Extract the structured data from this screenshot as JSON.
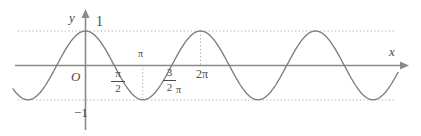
{
  "figure": {
    "background": "#ffffff",
    "width": 421,
    "height": 136
  },
  "axes": {
    "x_axis": {
      "label": "x",
      "color": "#8a8a8a",
      "arrow": "right"
    },
    "y_axis": {
      "label": "y",
      "color": "#8a8a8a",
      "arrow": "up"
    },
    "origin_label": "O"
  },
  "labels": {
    "y_max": "1",
    "y_min": "−1",
    "pi": "π",
    "two_pi": "2π",
    "pi_over_two_numerator": "π",
    "pi_over_two_denominator": "2",
    "three_halves_numerator": "3",
    "three_halves_denominator": "2",
    "three_halves_pi_tail": "π"
  },
  "guides": {
    "upper_dotted_value": 1,
    "lower_dotted_value": -1,
    "vertical_dotted_at": [
      "π",
      "2π"
    ],
    "color": "#a9a9a9",
    "style": "dotted"
  },
  "chart_data": {
    "type": "line",
    "title": "",
    "subtitle": "",
    "xlabel": "x",
    "ylabel": "y",
    "function": "y = cos(x)",
    "amplitude": 1,
    "period": "2π",
    "xlim": [
      -1.22,
      5.5
    ],
    "ylim": [
      -1.35,
      1.35
    ],
    "grid": false,
    "legend": null,
    "x_ticks": [
      {
        "value": 0,
        "label": "O"
      },
      {
        "value": 1.5707963,
        "label": "π/2"
      },
      {
        "value": 3.1415927,
        "label": "π"
      },
      {
        "value": 4.712389,
        "label": "3/2 π"
      },
      {
        "value": 6.2831853,
        "label": "2π"
      }
    ],
    "y_ticks": [
      {
        "value": 1,
        "label": "1"
      },
      {
        "value": -1,
        "label": "−1"
      }
    ],
    "key_points": [
      {
        "x": "0",
        "y": 1,
        "kind": "maximum"
      },
      {
        "x": "π/2",
        "y": 0,
        "kind": "zero"
      },
      {
        "x": "π",
        "y": -1,
        "kind": "minimum"
      },
      {
        "x": "3/2 π",
        "y": 0,
        "kind": "zero"
      },
      {
        "x": "2π",
        "y": 1,
        "kind": "maximum"
      },
      {
        "x": "5/2 π",
        "y": 0,
        "kind": "zero"
      },
      {
        "x": "3π",
        "y": -1,
        "kind": "minimum"
      },
      {
        "x": "7/2 π",
        "y": 0,
        "kind": "zero"
      },
      {
        "x": "4π",
        "y": 1,
        "kind": "maximum"
      }
    ],
    "series": [
      {
        "name": "y = cos x",
        "color": "#7d7d7d",
        "x": [
          -1.22,
          -1.0,
          -0.8,
          -0.6,
          -0.4,
          -0.2,
          0.0,
          0.2,
          0.4,
          0.6,
          0.8,
          1.0,
          1.2,
          1.4,
          1.5708,
          1.8,
          2.0,
          2.2,
          2.4,
          2.6,
          2.8,
          3.0,
          3.1416,
          3.4,
          3.6,
          3.8,
          4.0,
          4.2,
          4.4,
          4.6,
          4.7124,
          5.0,
          5.2,
          5.4,
          5.6,
          5.8,
          6.0,
          6.2832,
          6.6,
          6.8,
          7.0,
          7.2,
          7.4,
          7.6,
          7.8,
          7.854,
          8.2,
          8.4,
          8.6,
          8.8,
          9.0,
          9.2,
          9.4248,
          9.8,
          10.0,
          10.2,
          10.4,
          10.6,
          10.8,
          10.9956,
          11.4,
          11.6,
          11.8,
          12.0,
          12.2,
          12.4,
          12.5664,
          12.9,
          13.2
        ],
        "y": [
          0.344,
          0.54,
          0.697,
          0.825,
          0.921,
          0.98,
          1.0,
          0.98,
          0.921,
          0.825,
          0.697,
          0.54,
          0.362,
          0.17,
          0.0,
          -0.227,
          -0.416,
          -0.589,
          -0.737,
          -0.857,
          -0.942,
          -0.99,
          -1.0,
          -0.967,
          -0.897,
          -0.791,
          -0.654,
          -0.49,
          -0.307,
          -0.112,
          0.0,
          0.284,
          0.469,
          0.635,
          0.776,
          0.886,
          0.96,
          1.0,
          0.95,
          0.869,
          0.754,
          0.608,
          0.439,
          0.251,
          0.052,
          0.0,
          -0.335,
          -0.519,
          -0.682,
          -0.811,
          -0.911,
          -0.971,
          -1.0,
          -0.93,
          -0.839,
          -0.718,
          -0.569,
          -0.397,
          -0.208,
          0.0,
          0.387,
          0.568,
          0.725,
          0.844,
          0.938,
          0.987,
          1.0,
          0.914,
          0.78
        ]
      }
    ]
  }
}
